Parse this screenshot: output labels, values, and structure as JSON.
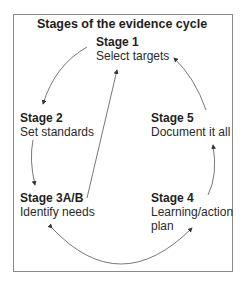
{
  "title": "Stages of the evidence cycle",
  "stages": [
    {
      "name": "Stage 1",
      "desc": "Select targets"
    },
    {
      "name": "Stage 2",
      "desc": "Set standards"
    },
    {
      "name": "Stage 3A/B",
      "desc": "Identify needs"
    },
    {
      "name": "Stage 4",
      "desc": "Learning/action plan"
    },
    {
      "name": "Stage 5",
      "desc": "Document it all"
    }
  ],
  "colors": {
    "line": "#444444",
    "border": "#8a8a8a",
    "text": "#222222"
  }
}
